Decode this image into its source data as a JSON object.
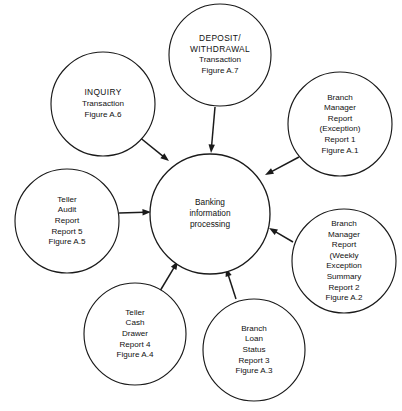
{
  "diagram": {
    "type": "radial-data-flow",
    "background_color": "#ffffff",
    "line_color": "#1a1a1a",
    "text_color": "#111111",
    "hub": {
      "id": "hub",
      "lines": [
        "Banking",
        "information",
        "processing"
      ],
      "cx": 210,
      "cy": 214,
      "r": 60
    },
    "nodes": [
      {
        "id": "deposit-withdrawal",
        "lines": [
          "DEPOSIT/",
          "WITHDRAWAL",
          "Transaction",
          "Figure  A.7"
        ],
        "caps_lines": 2,
        "cx": 220,
        "cy": 55,
        "r": 51,
        "arrow": {
          "x1": 215,
          "y1": 107,
          "x2": 211,
          "y2": 153,
          "direction": "to-hub"
        }
      },
      {
        "id": "inquiry",
        "lines": [
          "INQUIRY",
          "Transaction",
          "Figure  A.6"
        ],
        "caps_lines": 1,
        "cx": 103,
        "cy": 104,
        "r": 52,
        "arrow": {
          "x1": 138,
          "y1": 136,
          "x2": 169,
          "y2": 161,
          "direction": "to-hub"
        }
      },
      {
        "id": "branch-manager-exception",
        "lines": [
          "Branch",
          "Manager",
          "Report",
          "(Exception)",
          "Report  1",
          "Figure  A.1"
        ],
        "caps_lines": 0,
        "cx": 340,
        "cy": 124,
        "r": 52,
        "arrow": {
          "x1": 299,
          "y1": 157,
          "x2": 265,
          "y2": 175,
          "direction": "to-hub"
        }
      },
      {
        "id": "branch-manager-weekly",
        "lines": [
          "Branch",
          "Manager",
          "Report",
          "(Weekly",
          "Exception",
          "Summary",
          "Report  2",
          "Figure  A.2"
        ],
        "caps_lines": 0,
        "cx": 344,
        "cy": 261,
        "r": 52,
        "arrow": {
          "x1": 293,
          "y1": 242,
          "x2": 269,
          "y2": 228,
          "direction": "to-hub"
        }
      },
      {
        "id": "branch-loan-status",
        "lines": [
          "Branch",
          "Loan",
          "Status",
          "Report  3",
          "Figure  A.3"
        ],
        "caps_lines": 0,
        "cx": 254,
        "cy": 350,
        "r": 51,
        "arrow": {
          "x1": 236,
          "y1": 299,
          "x2": 226,
          "y2": 268,
          "direction": "to-hub"
        }
      },
      {
        "id": "teller-cash-drawer",
        "lines": [
          "Teller",
          "Cash",
          "Drawer",
          "Report  4",
          "Figure  A.4"
        ],
        "caps_lines": 0,
        "cx": 135,
        "cy": 334,
        "r": 51,
        "arrow": {
          "x1": 160,
          "y1": 291,
          "x2": 178,
          "y2": 261,
          "direction": "to-hub"
        }
      },
      {
        "id": "teller-audit-report",
        "lines": [
          "Teller",
          "Audit",
          "Report",
          "Report  5",
          "Figure  A.5"
        ],
        "caps_lines": 0,
        "cx": 67,
        "cy": 221,
        "r": 52,
        "arrow": {
          "x1": 119,
          "y1": 213,
          "x2": 151,
          "y2": 212,
          "direction": "to-hub"
        }
      }
    ]
  }
}
